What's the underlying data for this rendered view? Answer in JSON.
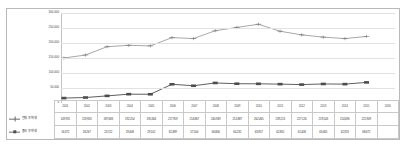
{
  "chart_data": {
    "type": "line",
    "title": "",
    "xlabel": "",
    "ylabel": "",
    "grid": true,
    "legend_position": "table-row-headers",
    "categories": [
      "2001",
      "2002",
      "2003",
      "2004",
      "2005",
      "2006",
      "2007",
      "2008",
      "2009",
      "2010",
      "2011",
      "2012",
      "2013",
      "2014",
      "2015",
      "2016"
    ],
    "ylim": [
      0,
      300000
    ],
    "yticks": [
      0,
      50000,
      100000,
      150000,
      200000,
      250000,
      300000
    ],
    "ytick_labels": [
      "0",
      "50,000",
      "100,000",
      "150,000",
      "200,000",
      "250,000",
      "300,000"
    ],
    "series": [
      {
        "name": "전체 유학생",
        "marker": "cross",
        "color": "#6d6d6d",
        "values": [
          149931,
          159903,
          187683,
          192254,
          190364,
          217959,
          214867,
          240949,
          251887,
          262465,
          239213,
          227126,
          219543,
          214696,
          221909,
          221909
        ]
      },
      {
        "name": "중국 유학생",
        "marker": "square",
        "color": "#4d4d4d",
        "values": [
          16372,
          18267,
          23722,
          29408,
          29102,
          42389,
          57504,
          66806,
          64232,
          63957,
          62855,
          61408,
          63465,
          62923,
          68672,
          68672
        ]
      }
    ],
    "table": {
      "year_header_blank": "",
      "rows": [
        {
          "label": "전체 유학생",
          "marker": "cross",
          "cells": [
            "149,931",
            "159,903",
            "187,683",
            "192,254",
            "190,364",
            "217,959",
            "214,867",
            "240,949",
            "251,887",
            "262,465",
            "239,213",
            "227,126",
            "219,543",
            "214,696",
            "221,909"
          ]
        },
        {
          "label": "중국 유학생",
          "marker": "square",
          "cells": [
            "16,372",
            "18,267",
            "23,722",
            "29,408",
            "29,102",
            "62,389",
            "57,504",
            "66,806",
            "64,232",
            "63,957",
            "62,855",
            "61,408",
            "63,465",
            "62,923",
            "68,672"
          ]
        }
      ],
      "years": [
        "2001",
        "2002",
        "2003",
        "2004",
        "2005",
        "2006",
        "2007",
        "2008",
        "2009",
        "2010",
        "2011",
        "2012",
        "2013",
        "2014",
        "2015",
        "2016"
      ]
    },
    "colors": {
      "line_total": "#6d6d6d",
      "line_china": "#4d4d4d",
      "gridline": "#e2e2e2",
      "border": "#b9b9b9"
    }
  }
}
